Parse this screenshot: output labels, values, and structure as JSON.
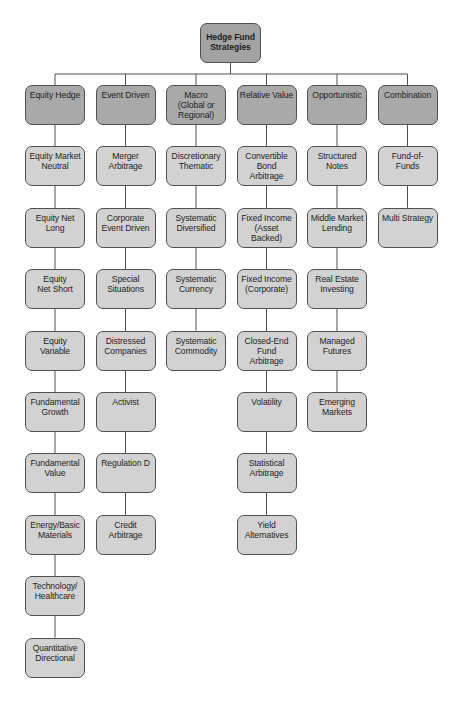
{
  "diagram": {
    "root": {
      "label": "Hedge Fund\nStrategies"
    },
    "columns": [
      {
        "label": "Equity Hedge",
        "children": [
          "Equity Market\nNeutral",
          "Equity Net\nLong",
          "Equity\nNet Short",
          "Equity Variable",
          "Fundamental\nGrowth",
          "Fundamental\nValue",
          "Energy/Basic\nMaterials",
          "Technology/\nHealthcare",
          "Quantitative\nDirectional"
        ]
      },
      {
        "label": "Event Driven",
        "children": [
          "Merger\nArbitrage",
          "Corporate\nEvent Driven",
          "Special\nSituations",
          "Distressed\nCompanies",
          "Activist",
          "Regulation D",
          "Credit\nArbitrage"
        ]
      },
      {
        "label": "Macro\n(Global or\nRegional)",
        "children": [
          "Discretionary\nThematic",
          "Systematic\nDiversified",
          "Systematic\nCurrency",
          "Systematic\nCommodity"
        ]
      },
      {
        "label": "Relative Value",
        "children": [
          "Convertible\nBond\nArbitrage",
          "Fixed Income\n(Asset Backed)",
          "Fixed Income\n(Corporate)",
          "Closed-End\nFund Arbitrage",
          "Volatility",
          "Statistical\nArbitrage",
          "Yield\nAlternatives"
        ]
      },
      {
        "label": "Opportunistic",
        "children": [
          "Structured\nNotes",
          "Middle Market\nLending",
          "Real Estate\nInvesting",
          "Managed\nFutures",
          "Emerging\nMarkets"
        ]
      },
      {
        "label": "Combination",
        "children": [
          "Fund-of-Funds",
          "Multi Strategy"
        ]
      }
    ],
    "colors": {
      "root_fill": "#a3a3a3",
      "category_fill": "#a9a9a9",
      "leaf_fill": "#d2d2d2",
      "border": "#505050",
      "connector": "#505050"
    }
  }
}
